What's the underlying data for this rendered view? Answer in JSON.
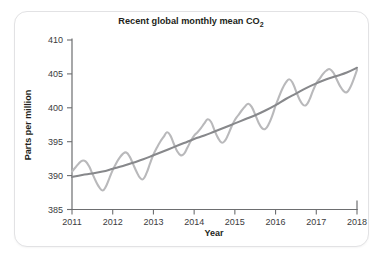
{
  "card": {
    "background": "#ffffff",
    "border_color": "#e2e2e4"
  },
  "chart_data": {
    "type": "line",
    "title": "Recent global monthly mean CO",
    "title_subscript": "2",
    "xlabel": "Year",
    "ylabel": "Parts per million",
    "xlim": [
      2011,
      2018
    ],
    "ylim": [
      385,
      410
    ],
    "xticks": [
      2011,
      2012,
      2013,
      2014,
      2015,
      2016,
      2017,
      2018
    ],
    "xtick_labels": [
      "2011",
      "2012",
      "2013",
      "2014",
      "2015",
      "2016",
      "2017",
      "2018"
    ],
    "yticks": [
      385,
      390,
      395,
      400,
      405,
      410
    ],
    "ytick_labels": [
      "385",
      "390",
      "395",
      "400",
      "405",
      "410"
    ],
    "grid": false,
    "legend": "none",
    "colors": {
      "seasonal": "#b9b9bb",
      "trend": "#87888b",
      "axis": "#6d6e70",
      "text": "#231f20"
    },
    "series": [
      {
        "name": "monthly mean",
        "color": "#b9b9bb",
        "x": [
          2011.0,
          2011.083,
          2011.167,
          2011.25,
          2011.333,
          2011.417,
          2011.5,
          2011.583,
          2011.667,
          2011.75,
          2011.833,
          2011.917,
          2012.0,
          2012.083,
          2012.167,
          2012.25,
          2012.333,
          2012.417,
          2012.5,
          2012.583,
          2012.667,
          2012.75,
          2012.833,
          2012.917,
          2013.0,
          2013.083,
          2013.167,
          2013.25,
          2013.333,
          2013.417,
          2013.5,
          2013.583,
          2013.667,
          2013.75,
          2013.833,
          2013.917,
          2014.0,
          2014.083,
          2014.167,
          2014.25,
          2014.333,
          2014.417,
          2014.5,
          2014.583,
          2014.667,
          2014.75,
          2014.833,
          2014.917,
          2015.0,
          2015.083,
          2015.167,
          2015.25,
          2015.333,
          2015.417,
          2015.5,
          2015.583,
          2015.667,
          2015.75,
          2015.833,
          2015.917,
          2016.0,
          2016.083,
          2016.167,
          2016.25,
          2016.333,
          2016.417,
          2016.5,
          2016.583,
          2016.667,
          2016.75,
          2016.833,
          2016.917,
          2017.0,
          2017.083,
          2017.167,
          2017.25,
          2017.333,
          2017.417,
          2017.5,
          2017.583,
          2017.667,
          2017.75,
          2017.833,
          2017.917,
          2018.0
        ],
        "values": [
          390.6,
          391.2,
          391.8,
          392.2,
          392.1,
          391.4,
          390.3,
          389.2,
          388.3,
          387.8,
          388.4,
          389.6,
          390.8,
          391.8,
          392.6,
          393.2,
          393.4,
          392.8,
          391.7,
          390.6,
          389.7,
          389.5,
          390.4,
          391.8,
          393.1,
          394.1,
          395.0,
          395.7,
          396.4,
          395.9,
          394.7,
          393.6,
          393.0,
          393.2,
          394.1,
          395.1,
          395.9,
          396.4,
          397.0,
          397.7,
          398.3,
          397.9,
          396.7,
          395.6,
          394.9,
          395.1,
          396.0,
          397.2,
          398.2,
          398.9,
          399.6,
          400.2,
          400.6,
          400.1,
          399.0,
          397.8,
          397.0,
          396.9,
          397.6,
          398.8,
          400.3,
          401.6,
          402.8,
          403.7,
          404.2,
          403.7,
          402.5,
          401.3,
          400.5,
          400.4,
          401.2,
          402.5,
          403.6,
          404.3,
          405.0,
          405.5,
          405.7,
          405.2,
          404.2,
          403.2,
          402.5,
          402.3,
          403.0,
          404.2,
          405.6
        ]
      },
      {
        "name": "trend",
        "color": "#87888b",
        "x": [
          2011.0,
          2011.25,
          2011.5,
          2011.75,
          2012.0,
          2012.25,
          2012.5,
          2012.75,
          2013.0,
          2013.25,
          2013.5,
          2013.75,
          2014.0,
          2014.25,
          2014.5,
          2014.75,
          2015.0,
          2015.25,
          2015.5,
          2015.75,
          2016.0,
          2016.25,
          2016.5,
          2016.75,
          2017.0,
          2017.25,
          2017.5,
          2017.75,
          2018.0
        ],
        "values": [
          389.8,
          390.1,
          390.3,
          390.6,
          391.0,
          391.4,
          391.9,
          392.4,
          393.0,
          393.6,
          394.2,
          394.8,
          395.4,
          395.9,
          396.5,
          397.1,
          397.7,
          398.3,
          398.9,
          399.6,
          400.4,
          401.3,
          402.1,
          402.9,
          403.6,
          404.2,
          404.7,
          405.2,
          405.9
        ]
      }
    ]
  }
}
